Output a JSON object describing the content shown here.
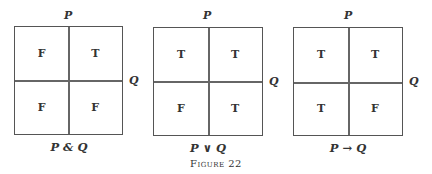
{
  "figure": {
    "label": "Figure 22",
    "row_variable": "P",
    "col_variable": "Q",
    "diagrams": [
      {
        "caption": "P & Q",
        "p_label": "P",
        "q_label": "Q",
        "cells": {
          "top_left": "F",
          "top_right": "T",
          "bottom_left": "F",
          "bottom_right": "F"
        }
      },
      {
        "caption": "P ∨ Q",
        "p_label": "P",
        "q_label": "Q",
        "cells": {
          "top_left": "T",
          "top_right": "T",
          "bottom_left": "F",
          "bottom_right": "T"
        }
      },
      {
        "caption": "P → Q",
        "p_label": "P",
        "q_label": "Q",
        "cells": {
          "top_left": "T",
          "top_right": "T",
          "bottom_left": "T",
          "bottom_right": "F"
        }
      }
    ]
  }
}
